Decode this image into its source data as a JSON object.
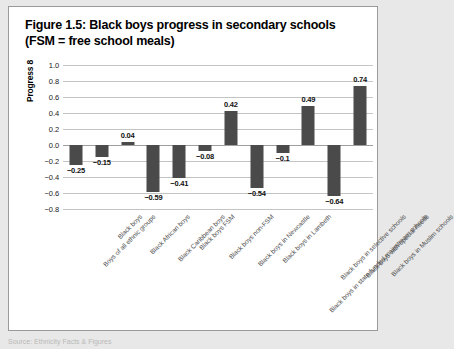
{
  "figure": {
    "title_line_1": "Figure 1.5: Black boys progress in secondary schools",
    "title_line_2": "(FSM = free school meals)",
    "source_note": "Source: Ethnicity Facts & Figures"
  },
  "chart_data": {
    "type": "bar",
    "title": "Figure 1.5: Black boys progress in secondary schools (FSM = free school meals)",
    "xlabel": "",
    "ylabel": "Progress 8",
    "ylim": [
      -0.8,
      1.0
    ],
    "ytick_step": 0.2,
    "yticks": [
      "1.0",
      "0.8",
      "0.6",
      "0.4",
      "0.2",
      "0.0",
      "-0.2",
      "-0.4",
      "-0.6",
      "-0.8"
    ],
    "grid": true,
    "legend": "none",
    "bar_color": "#4a4a4a",
    "gridline_color": "#c4c4c4",
    "categories": [
      "Boys of all ethnic groups",
      "Black boys",
      "Black African boys",
      "Black Caribbean boys",
      "Black boys FSM",
      "Black boys non-FSM",
      "Black boys in Newcastle",
      "Black boys in Lambeth",
      "Black boys in state-funded mainstream schools",
      "Black boys in selective schools",
      "Black boys with special needs",
      "Black boys in Muslim schools"
    ],
    "values": [
      -0.25,
      -0.15,
      0.04,
      -0.59,
      -0.41,
      -0.08,
      0.42,
      -0.54,
      -0.1,
      0.49,
      -0.64,
      0.74
    ],
    "value_labels": [
      "-0.25",
      "-0.15",
      "0.04",
      "-0.59",
      "-0.41",
      "-0.08",
      "0.42",
      "-0.54",
      "-0.1",
      "0.49",
      "-0.64",
      "0.74"
    ]
  }
}
